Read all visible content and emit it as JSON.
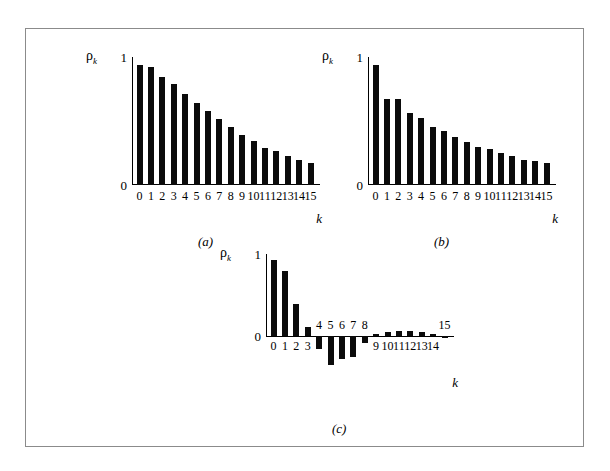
{
  "figure": {
    "background_color": "#ffffff",
    "frame_color": "#8b8b8b",
    "bar_color": "#0b0b0b"
  },
  "axis_labels": {
    "y_symbol": "ρ",
    "y_subscript": "k",
    "x_symbol": "k",
    "y_tick_one": "1",
    "y_tick_zero": "0"
  },
  "panels": [
    {
      "id": "a",
      "caption": "(a)",
      "chart_data": {
        "type": "bar",
        "title": "",
        "xlabel": "k",
        "ylabel": "ρk",
        "ylim": [
          0,
          1
        ],
        "ytick_labels": [
          "0",
          "1"
        ],
        "grid": false,
        "legend": "none",
        "categories": [
          "0",
          "1",
          "2",
          "3",
          "4",
          "5",
          "6",
          "7",
          "8",
          "9",
          "10",
          "11",
          "12",
          "13",
          "14",
          "15"
        ],
        "values": [
          1.0,
          0.98,
          0.9,
          0.84,
          0.76,
          0.68,
          0.62,
          0.55,
          0.48,
          0.42,
          0.37,
          0.31,
          0.28,
          0.24,
          0.21,
          0.18
        ]
      }
    },
    {
      "id": "b",
      "caption": "(b)",
      "chart_data": {
        "type": "bar",
        "title": "",
        "xlabel": "k",
        "ylabel": "ρk",
        "ylim": [
          0,
          1
        ],
        "ytick_labels": [
          "0",
          "1"
        ],
        "grid": false,
        "legend": "none",
        "categories": [
          "0",
          "1",
          "2",
          "3",
          "4",
          "5",
          "6",
          "7",
          "8",
          "9",
          "10",
          "11",
          "12",
          "13",
          "14",
          "15"
        ],
        "values": [
          1.0,
          0.72,
          0.72,
          0.6,
          0.56,
          0.48,
          0.45,
          0.4,
          0.36,
          0.32,
          0.3,
          0.27,
          0.24,
          0.21,
          0.2,
          0.18
        ]
      }
    },
    {
      "id": "c",
      "caption": "(c)",
      "chart_data": {
        "type": "bar",
        "title": "",
        "xlabel": "k",
        "ylabel": "ρk",
        "ylim": [
          -0.45,
          1
        ],
        "ytick_labels": [
          "0",
          "1"
        ],
        "grid": false,
        "legend": "none",
        "categories": [
          "0",
          "1",
          "2",
          "3",
          "4",
          "5",
          "6",
          "7",
          "8",
          "9",
          "10",
          "11",
          "12",
          "13",
          "14",
          "15"
        ],
        "values": [
          1.0,
          0.85,
          0.42,
          0.12,
          -0.17,
          -0.38,
          -0.3,
          -0.27,
          -0.09,
          0.02,
          0.05,
          0.07,
          0.06,
          0.05,
          0.03,
          -0.03
        ]
      }
    }
  ]
}
